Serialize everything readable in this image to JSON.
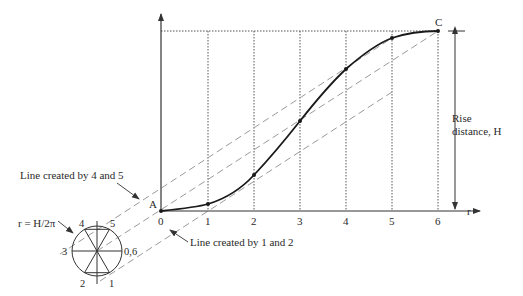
{
  "figure": {
    "labels": {
      "point_a": "A",
      "point_c": "C",
      "radius": "r = H/2π",
      "rise_line1": "Rise",
      "rise_line2": "distance, H",
      "line_45": "Line created by 4 and 5",
      "line_12": "Line created by 1 and 2",
      "r_axis": "r"
    },
    "x_ticks": [
      "0",
      "1",
      "2",
      "3",
      "4",
      "5",
      "6"
    ],
    "circle_labels": {
      "p0_6": "0,6",
      "p1": "1",
      "p2": "2",
      "p3": "3",
      "p4": "4",
      "p5": "5"
    },
    "colors": {
      "curve": "#1a1a1a",
      "axis": "#333333",
      "dashed": "#999999",
      "grid": "#444444"
    }
  }
}
